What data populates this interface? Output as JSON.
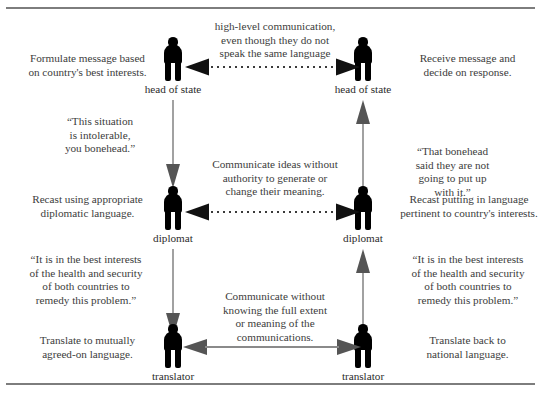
{
  "diagram": {
    "title_present": false,
    "frame": {
      "color": "#7d7d7d"
    },
    "levels": [
      {
        "id": "head-of-state",
        "role_label_left": "head of state",
        "role_label_right": "head of state",
        "center_text": "high-level communication,\neven though they do not\nspeak the same language",
        "left_text": "Formulate message based\non country's best interests.",
        "right_text": "Receive message and\ndecide on response.",
        "connector_style": "dotted",
        "connector_direction": "bidirectional"
      },
      {
        "id": "diplomat",
        "role_label_left": "diplomat",
        "role_label_right": "diplomat",
        "center_text": "Communicate ideas without\nauthority to generate or\nchange their meaning.",
        "left_text": "Recast using appropriate\ndiplomatic language.",
        "right_text": "Recast putting in language\npertinent to country's interests.",
        "connector_style": "dotted",
        "connector_direction": "bidirectional"
      },
      {
        "id": "translator",
        "role_label_left": "translator",
        "role_label_right": "translator",
        "center_text": "Communicate without\nknowing the full extent\nor meaning of the\ncommunications.",
        "left_text": "Translate to mutually\nagreed-on language.",
        "right_text": "Translate back to\nnational language.",
        "connector_style": "solid",
        "connector_direction": "bidirectional"
      }
    ],
    "quotes": [
      {
        "id": "quote-left-upper",
        "text": "“This situation\nis intolerable,\nyou bonehead.”"
      },
      {
        "id": "quote-right-upper",
        "text": "“That bonehead\nsaid they are not\ngoing to put up\nwith it.”"
      },
      {
        "id": "quote-left-lower",
        "text": "“It is in the best interests\nof the health and security\nof both countries to\nremedy this problem.”"
      },
      {
        "id": "quote-right-lower",
        "text": "“It is in the best interests\nof the health and security\nof both countries to\nremedy this problem.”"
      }
    ],
    "vertical_flows": [
      {
        "id": "left-flow-1",
        "direction": "down",
        "from": "head of state",
        "to": "diplomat"
      },
      {
        "id": "left-flow-2",
        "direction": "down",
        "from": "diplomat",
        "to": "translator"
      },
      {
        "id": "right-flow-1",
        "direction": "up",
        "from": "diplomat",
        "to": "head of state"
      },
      {
        "id": "right-flow-2",
        "direction": "up",
        "from": "translator",
        "to": "diplomat"
      }
    ],
    "figure_icon_name": "person-silhouette-icon"
  }
}
